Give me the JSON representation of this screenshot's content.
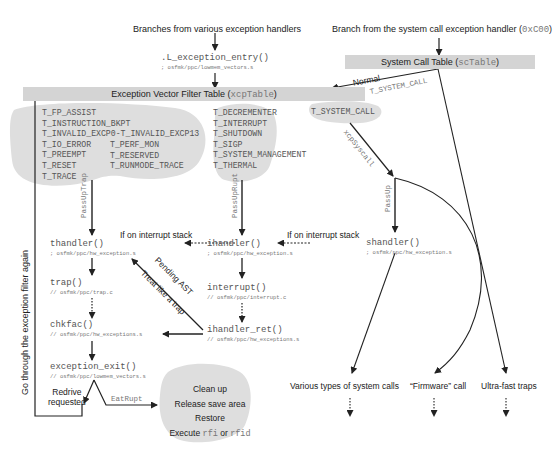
{
  "headers": {
    "left": "Branches from various exception handlers",
    "right_prefix": "Branch from the system call exception handler (",
    "right_code": "0xC00",
    "right_suffix": ")"
  },
  "entry": {
    "fn": ".L_exception_entry()",
    "path": "; osfmk/ppc/lowmem_vectors.s"
  },
  "sc_table": {
    "label": "System Call Table (",
    "code": "scTable",
    "suffix": ")"
  },
  "xcp_table": {
    "label": "Exception Vector Filter Table (",
    "code": "xcpTable",
    "suffix": ")"
  },
  "edges": {
    "normal": "Normal",
    "t_system_call_edge": "T_SYSTEM_CALL",
    "xcp_syscall": "xcpSyscall",
    "pass_up_trap": "PassUpTrap",
    "pass_up_rupt": "PassUpRupt",
    "pass_up": "PassUp",
    "if_on_interrupt_stack_1": "If on interrupt stack",
    "if_on_interrupt_stack_2": "If on interrupt stack",
    "pending_ast": "Pending AST",
    "treat_like_trap": "Treat like a trap",
    "go_through": "Go through the exception filter again",
    "redrive": "Redrive",
    "requested": "requested",
    "eat_rupt": "EatRupt"
  },
  "groups": {
    "trap_left": [
      "T_FP_ASSIST",
      "T_INSTRUCTION_BKPT",
      "T_INVALID_EXCP0-T_INVALID_EXCP13",
      "T_IO_ERROR",
      "T_PREEMPT",
      "T_RESET",
      "T_TRACE"
    ],
    "trap_right": [
      "T_PERF_MON",
      "T_RESERVED",
      "T_RUNMODE_TRACE"
    ],
    "interrupt": [
      "T_DECREMENTER",
      "T_INTERRUPT",
      "T_SHUTDOWN",
      "T_SIGP",
      "T_SYSTEM_MANAGEMENT",
      "T_THERMAL"
    ],
    "syscall": [
      "T_SYSTEM_CALL"
    ]
  },
  "nodes": {
    "thandler": {
      "fn": "thandler()",
      "path": "; osfmk/ppc/hw_exception.s"
    },
    "ihandler": {
      "fn": "ihandler()",
      "path": "; osfmk/ppc/hw_exception.s"
    },
    "shandler": {
      "fn": "shandler()",
      "path": "; osfmk/ppc/hw_exception.s"
    },
    "trap": {
      "fn": "trap()",
      "path": "// osfmk/ppc/trap.c"
    },
    "interrupt": {
      "fn": "interrupt()",
      "path": "// osfmk/ppc/interrupt.c"
    },
    "chkfac": {
      "fn": "chkfac()",
      "path": "// osfmk/ppc/hw_exceptions.s"
    },
    "ihandler_ret": {
      "fn": "ihandler_ret()",
      "path": "// osfmk/ppc/hw_exceptions.s"
    },
    "exception_exit": {
      "fn": "exception_exit()",
      "path": "// osfmk/ppc/lowmem_vectors.s"
    }
  },
  "cleanup": {
    "line1": "Clean up",
    "line2": "Release save area",
    "line3": "Restore",
    "line4_prefix": "Execute ",
    "line4_code1": "rfi",
    "line4_mid": " or ",
    "line4_code2": "rfid"
  },
  "outcomes": {
    "syscalls": "Various types of system calls",
    "firmware": "“Firmware” call",
    "ultrafast": "Ultra-fast traps"
  },
  "colors": {
    "bar": "#d4d4d4",
    "blob": "#dedede",
    "line": "#222222"
  }
}
